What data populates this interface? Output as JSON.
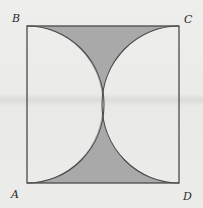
{
  "figure": {
    "vertices": {
      "top_left": "B",
      "top_right": "C",
      "bottom_left": "A",
      "bottom_right": "D"
    },
    "colors": {
      "shade": "#a9a9a9",
      "stroke": "#4a4a4a",
      "background": "#ececea"
    }
  }
}
